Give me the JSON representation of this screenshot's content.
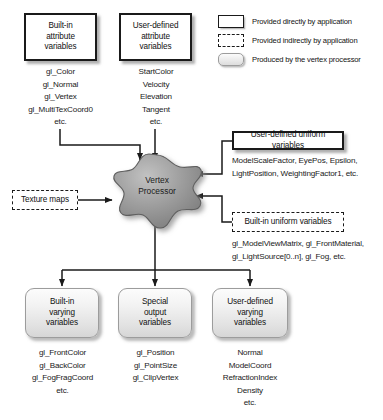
{
  "diagram": {
    "center": {
      "label_line1": "Vertex",
      "label_line2": "Processor",
      "fill_color": "#9a9a9a"
    }
  },
  "legend": {
    "items": [
      {
        "swatch": "solid-box",
        "text": "Provided directly by application"
      },
      {
        "swatch": "dashed-box",
        "text": "Provided indirectly by application"
      },
      {
        "swatch": "rounded-gradient-box",
        "text": "Produced by the vertex processor"
      }
    ]
  },
  "inputs": {
    "builtin_attribute": {
      "box": {
        "line1": "Built-in",
        "line2": "attribute",
        "line3": "variables"
      },
      "items": [
        "gl_Color",
        "gl_Normal",
        "gl_Vertex",
        "gl_MultiTexCoord0",
        "etc."
      ]
    },
    "user_attribute": {
      "box": {
        "line1": "User-defined",
        "line2": "attribute",
        "line3": "variables"
      },
      "items": [
        "StartColor",
        "Velocity",
        "Elevation",
        "Tangent",
        "etc."
      ]
    },
    "texture_maps": {
      "box": {
        "line1": "Texture maps"
      }
    },
    "user_uniform": {
      "box": {
        "line1": "User-defined uniform variables"
      },
      "items": [
        "ModelScaleFactor, EyePos, Epsilon,",
        "LightPosition, WeightingFactor1, etc."
      ]
    },
    "builtin_uniform": {
      "box": {
        "line1": "Built-in uniform variables"
      },
      "items": [
        "gl_ModelViewMatrix, gl_FrontMaterial,",
        "gl_LightSource[0..n],  gl_Fog, etc."
      ]
    }
  },
  "outputs": {
    "builtin_varying": {
      "box": {
        "line1": "Built-in",
        "line2": "varying",
        "line3": "variables"
      },
      "items": [
        "gl_FrontColor",
        "gl_BackColor",
        "gl_FogFragCoord",
        "etc."
      ]
    },
    "special_output": {
      "box": {
        "line1": "Special",
        "line2": "output",
        "line3": "variables"
      },
      "items": [
        "gl_Position",
        "gl_PointSize",
        "gl_ClipVertex"
      ]
    },
    "user_varying": {
      "box": {
        "line1": "User-defined",
        "line2": "varying",
        "line3": "variables"
      },
      "items": [
        "Normal",
        "ModelCoord",
        "RefractionIndex",
        "Density",
        "etc."
      ]
    }
  }
}
